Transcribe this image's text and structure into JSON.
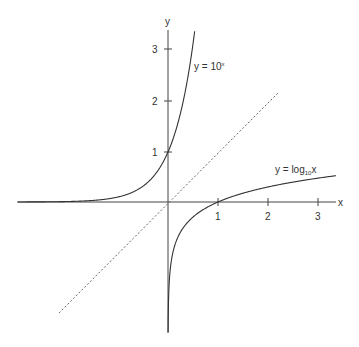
{
  "chart_data": {
    "type": "line",
    "title": "",
    "xlabel": "x",
    "ylabel": "y",
    "xlim": [
      -3.0,
      3.35
    ],
    "ylim": [
      -2.6,
      3.45
    ],
    "grid": false,
    "legend": "none",
    "x_ticks": [
      1,
      2,
      3
    ],
    "x_tick_labels": [
      "1",
      "2",
      "3"
    ],
    "y_ticks": [
      1,
      2,
      3
    ],
    "y_tick_labels": [
      "1",
      "2",
      "3"
    ],
    "series": [
      {
        "name": "y = 10^x",
        "style": "solid",
        "function": "10^x",
        "x_range": [
          -3.0,
          0.56
        ]
      },
      {
        "name": "y = log10 x",
        "style": "solid",
        "function": "log10(x)",
        "x_range": [
          0.0025,
          3.36
        ]
      },
      {
        "name": "y = x",
        "style": "dashed",
        "function": "x",
        "x_range": [
          -2.18,
          2.2
        ]
      }
    ],
    "annotations": [
      {
        "text": "y = 10ˣ",
        "x": 0.5,
        "y": 2.7
      },
      {
        "text": "y = log₁₀x",
        "x": 2.1,
        "y": 0.65
      }
    ]
  },
  "labels": {
    "x_axis": "x",
    "y_axis": "y",
    "exp_label_main": "y = 10",
    "exp_label_sup": "x",
    "log_label_main": "y = log",
    "log_label_sub": "10",
    "log_label_var": "x",
    "tick_x1": "1",
    "tick_x2": "2",
    "tick_x3": "3",
    "tick_y1": "1",
    "tick_y2": "2",
    "tick_y3": "3"
  },
  "colors": {
    "curve": "#333333",
    "axis": "#444444",
    "dashed": "#666666"
  }
}
